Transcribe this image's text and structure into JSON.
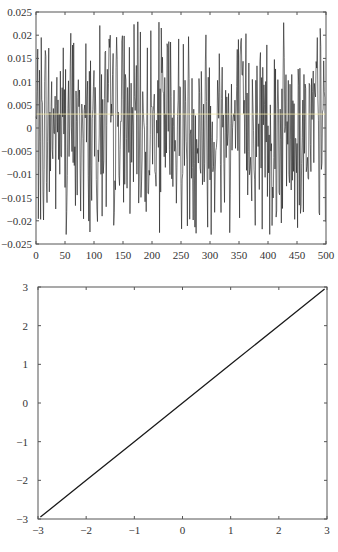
{
  "chart_data": [
    {
      "type": "line",
      "title": "",
      "xlabel": "",
      "ylabel": "",
      "xlim": [
        0,
        500
      ],
      "ylim": [
        -0.025,
        0.025
      ],
      "xticks": [
        0,
        50,
        100,
        150,
        200,
        250,
        300,
        350,
        400,
        450,
        500
      ],
      "xtick_labels": [
        "0",
        "50",
        "100",
        "150",
        "200",
        "250",
        "300",
        "350",
        "400",
        "450",
        "500"
      ],
      "yticks": [
        0.025,
        0.02,
        0.015,
        0.01,
        0.005,
        0,
        -0.005,
        -0.01,
        -0.015,
        -0.02,
        -0.025
      ],
      "ytick_labels": [
        "0.025",
        "0.02",
        "0.015",
        "0.01",
        "0.005",
        "0",
        "-0.005",
        "-0.01",
        "-0.015",
        "-0.02",
        "-0.025"
      ],
      "grid": false,
      "legend": null,
      "series": [
        {
          "name": "noise",
          "description": "approx. 500 samples of zero-mean random noise, amplitude within about ±0.023",
          "n_points": 500,
          "amplitude": 0.023,
          "seed": 7,
          "color": "#1a1a1a"
        }
      ],
      "annotations": [
        {
          "type": "hline",
          "y": 0.003,
          "color": "#f3e9a8",
          "note": "faint horizontal line near y≈0.003"
        }
      ]
    },
    {
      "type": "line",
      "title": "",
      "xlabel": "",
      "ylabel": "",
      "xlim": [
        -3,
        3
      ],
      "ylim": [
        -3,
        3
      ],
      "xticks": [
        -3,
        -2,
        -1,
        0,
        1,
        2,
        3
      ],
      "xtick_labels": [
        "-3",
        "-2",
        "-1",
        "0",
        "1",
        "2",
        "3"
      ],
      "yticks": [
        3,
        2,
        1,
        0,
        -1,
        -2,
        -3
      ],
      "ytick_labels": [
        "3",
        "2",
        "1",
        "0",
        "-1",
        "-2",
        "-3"
      ],
      "grid": false,
      "legend": null,
      "series": [
        {
          "name": "quantile-quantile",
          "x": [
            -2.95,
            -2,
            -1,
            0,
            1,
            2,
            2.95
          ],
          "y": [
            -2.95,
            -2,
            -1,
            0,
            1,
            2,
            2.95
          ],
          "color": "#1a1a1a"
        }
      ]
    }
  ],
  "layout": {
    "top_plot": {
      "left": 36,
      "top": 12,
      "right": 326,
      "bottom": 244
    },
    "bottom_plot": {
      "left": 38,
      "top": 287,
      "right": 327,
      "bottom": 519
    }
  }
}
